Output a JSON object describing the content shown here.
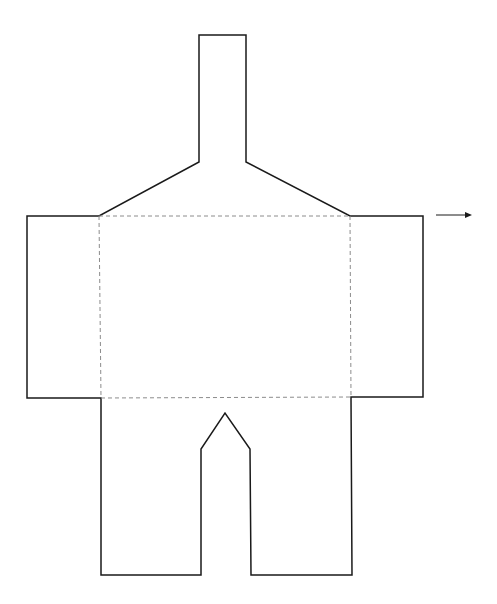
{
  "diagram": {
    "colors": {
      "outline": "#1a1a1a",
      "fold_line": "#8c8c8c",
      "background": "#ffffff"
    },
    "outline_points": [
      [
        199,
        35
      ],
      [
        246,
        35
      ],
      [
        246,
        162
      ],
      [
        350,
        216
      ],
      [
        423,
        216
      ],
      [
        423,
        397
      ],
      [
        351,
        397
      ],
      [
        352,
        575
      ],
      [
        251,
        575
      ],
      [
        250,
        449
      ],
      [
        225,
        413
      ],
      [
        201,
        449
      ],
      [
        201,
        575
      ],
      [
        101,
        575
      ],
      [
        101,
        398
      ],
      [
        27,
        398
      ],
      [
        27,
        216
      ],
      [
        99,
        216
      ],
      [
        199,
        162
      ]
    ],
    "fold_lines": [
      {
        "name": "top-fold",
        "x1": 99,
        "y1": 216,
        "x2": 350,
        "y2": 216
      },
      {
        "name": "bottom-fold",
        "x1": 101,
        "y1": 398,
        "x2": 351,
        "y2": 397
      },
      {
        "name": "left-fold",
        "x1": 99,
        "y1": 216,
        "x2": 101,
        "y2": 398
      },
      {
        "name": "right-fold",
        "x1": 350,
        "y1": 216,
        "x2": 351,
        "y2": 397
      }
    ],
    "arrow": {
      "x1": 436,
      "y1": 215,
      "x2": 472,
      "y2": 215,
      "direction": "right"
    }
  }
}
